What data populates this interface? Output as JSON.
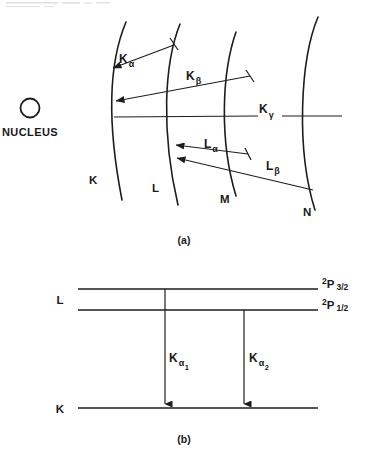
{
  "figure": {
    "background_color": "#ffffff",
    "ink_color": "#1d1d1d"
  },
  "panel_a": {
    "caption": "(a)",
    "nucleus": {
      "label": "NUCLEUS",
      "icon": "circle-outline"
    },
    "shells": [
      {
        "id": "K",
        "label": "K",
        "label_x": 89,
        "label_y": 184,
        "path": "M 126 22 C 110 60, 106 118, 122 200"
      },
      {
        "id": "L",
        "label": "L",
        "label_x": 152,
        "label_y": 192,
        "path": "M 180 24 C 164 64, 161 132, 178 205"
      },
      {
        "id": "M",
        "label": "M",
        "label_x": 220,
        "label_y": 203,
        "path": "M 236 32 C 222 72, 219 140, 236 196"
      },
      {
        "id": "N",
        "label": "N",
        "label_x": 303,
        "label_y": 216,
        "path": "M 318 17 C 300 60, 296 150, 315 210"
      }
    ],
    "transitions": [
      {
        "id": "K-alpha",
        "label": "K",
        "subscript": "α",
        "label_x": 119,
        "label_y": 63,
        "sub_dx": 9,
        "sub_dy": 4,
        "from_shell": "L",
        "to_shell": "K",
        "line": {
          "x1": 174,
          "y1": 45,
          "x2": 110,
          "y2": 69
        },
        "arrow_at": "end",
        "tick": {
          "x1": 170,
          "y1": 38,
          "x2": 178,
          "y2": 50
        }
      },
      {
        "id": "K-beta",
        "label": "K",
        "subscript": "β",
        "label_x": 186,
        "label_y": 80,
        "sub_dx": 9,
        "sub_dy": 4,
        "from_shell": "M",
        "to_shell": "K",
        "line": {
          "x1": 250,
          "y1": 76,
          "x2": 113,
          "y2": 102
        },
        "arrow_at": "end",
        "tick": {
          "x1": 246,
          "y1": 70,
          "x2": 254,
          "y2": 82
        }
      },
      {
        "id": "K-gamma",
        "label": "K",
        "subscript": "γ",
        "label_x": 262,
        "label_y": 110,
        "sub_dx": 9,
        "sub_dy": 5,
        "from_shell": "N",
        "to_shell": "K",
        "line": {
          "x1": 340,
          "y1": 116,
          "x2": 114,
          "y2": 117
        },
        "arrow_at": "none",
        "tick": null
      },
      {
        "id": "L-alpha",
        "label": "L",
        "subscript": "α",
        "label_x": 204,
        "label_y": 148,
        "sub_dx": 8,
        "sub_dy": 4,
        "from_shell": "M",
        "to_shell": "L",
        "line": {
          "x1": 248,
          "y1": 154,
          "x2": 174,
          "y2": 145
        },
        "arrow_at": "end",
        "tick": {
          "x1": 244,
          "y1": 148,
          "x2": 252,
          "y2": 160
        }
      },
      {
        "id": "L-beta",
        "label": "L",
        "subscript": "β",
        "label_x": 268,
        "label_y": 170,
        "sub_dx": 8,
        "sub_dy": 4,
        "from_shell": "N",
        "to_shell": "L",
        "line": {
          "x1": 312,
          "y1": 190,
          "x2": 174,
          "y2": 158
        },
        "arrow_at": "end",
        "tick": null
      }
    ]
  },
  "panel_b": {
    "caption": "(b)",
    "levels": [
      {
        "id": "L-upper",
        "group_label": "L",
        "term_base": "P",
        "term_superscript": "2",
        "term_subscript": "3/2",
        "y": 289,
        "x1": 78,
        "x2": 318
      },
      {
        "id": "L-lower",
        "group_label": "",
        "term_base": "P",
        "term_superscript": "2",
        "term_subscript": "1/2",
        "y": 310,
        "x1": 78,
        "x2": 318
      },
      {
        "id": "K-ground",
        "group_label": "K",
        "term_base": "",
        "term_superscript": "",
        "term_subscript": "",
        "y": 408,
        "x1": 78,
        "x2": 318
      }
    ],
    "group_labels": [
      {
        "id": "L-group",
        "text": "L",
        "x": 60,
        "y": 303
      },
      {
        "id": "K-group",
        "text": "K",
        "x": 60,
        "y": 412
      }
    ],
    "transitions": [
      {
        "id": "K-alpha-1",
        "label": "K",
        "subscript": "α",
        "sub_subscript": "1",
        "x": 165,
        "y_from": 289,
        "y_to": 406,
        "label_x": 168,
        "label_y": 365
      },
      {
        "id": "K-alpha-2",
        "label": "K",
        "subscript": "α",
        "sub_subscript": "2",
        "x": 244,
        "y_from": 310,
        "y_to": 406,
        "label_x": 249,
        "label_y": 365
      }
    ]
  },
  "artifacts": {
    "top_smudge_present": true
  }
}
